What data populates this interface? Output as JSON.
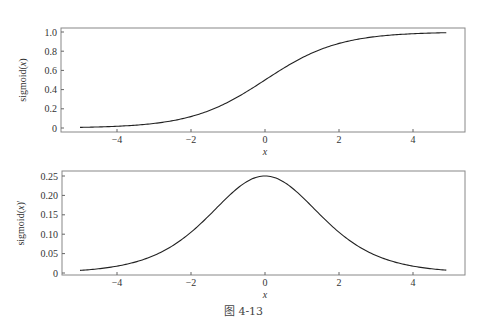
{
  "chart_data": [
    {
      "type": "line",
      "title": "",
      "xlabel": "x",
      "ylabel": "sigmoid(x)",
      "xlim": [
        -5.6,
        5.4
      ],
      "ylim": [
        -0.04,
        1.04
      ],
      "xticks": [
        -4,
        -2,
        0,
        2,
        4
      ],
      "xtick_labels": [
        "-4",
        "-2",
        "0",
        "2",
        "4"
      ],
      "yticks": [
        0,
        0.2,
        0.4,
        0.6,
        0.8,
        1.0
      ],
      "ytick_labels": [
        "0",
        "0.2",
        "0.4",
        "0.6",
        "0.8",
        "1.0"
      ],
      "grid": false,
      "series": [
        {
          "name": "sigmoid(x)",
          "function": "1/(1+exp(-x))",
          "x": [
            -5,
            -4,
            -3,
            -2,
            -1,
            0,
            1,
            2,
            3,
            4,
            4.9
          ],
          "y": [
            0.007,
            0.018,
            0.047,
            0.119,
            0.269,
            0.5,
            0.731,
            0.881,
            0.953,
            0.982,
            0.993
          ]
        }
      ]
    },
    {
      "type": "line",
      "title": "",
      "xlabel": "x",
      "ylabel": "sigmoid(x)'",
      "xlim": [
        -5.6,
        5.4
      ],
      "ylim": [
        -0.002,
        0.257
      ],
      "xticks": [
        -4,
        -2,
        0,
        2,
        4
      ],
      "xtick_labels": [
        "-4",
        "-2",
        "0",
        "2",
        "4"
      ],
      "yticks": [
        0,
        0.05,
        0.1,
        0.15,
        0.2,
        0.25
      ],
      "ytick_labels": [
        "0",
        "0.05",
        "0.10",
        "0.15",
        "0.20",
        "0.25"
      ],
      "grid": false,
      "series": [
        {
          "name": "sigmoid(x)'",
          "function": "sigmoid(x)*(1-sigmoid(x))",
          "x": [
            -5,
            -4,
            -3,
            -2,
            -1,
            0,
            1,
            2,
            3,
            4,
            4.9
          ],
          "y": [
            0.0066,
            0.0177,
            0.0452,
            0.105,
            0.197,
            0.25,
            0.197,
            0.105,
            0.0452,
            0.0177,
            0.0074
          ]
        }
      ]
    }
  ],
  "caption": "图 4-13"
}
